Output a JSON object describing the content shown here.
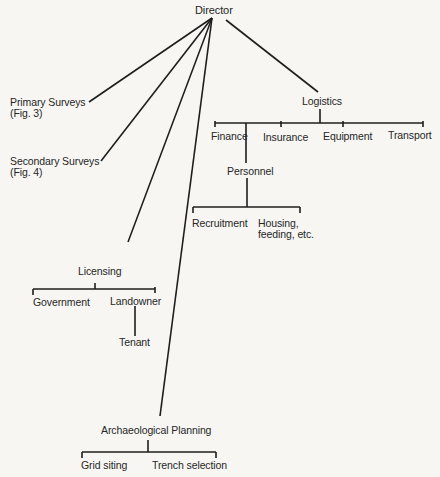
{
  "diagram": {
    "root": "Director",
    "branches": {
      "primary_surveys": "Primary Surveys\n(Fig. 3)",
      "secondary_surveys": "Secondary Surveys\n(Fig. 4)",
      "licensing": {
        "label": "Licensing",
        "children": {
          "government": "Government",
          "landowner": "Landowner",
          "tenant": "Tenant"
        }
      },
      "archaeological_planning": {
        "label": "Archaeological Planning",
        "children": {
          "grid_siting": "Grid siting",
          "trench_selection": "Trench selection"
        }
      },
      "logistics": {
        "label": "Logistics",
        "children": {
          "finance": "Finance",
          "insurance": "Insurance",
          "equipment": "Equipment",
          "transport": "Transport",
          "personnel": {
            "label": "Personnel",
            "children": {
              "recruitment": "Recruitment",
              "housing": "Housing,\nfeeding, etc."
            }
          }
        }
      }
    },
    "line_color": "#1a1a1a"
  }
}
